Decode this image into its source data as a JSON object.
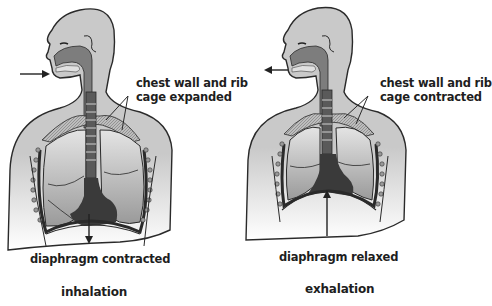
{
  "figures": [
    {
      "id": "inhalation",
      "title": "inhalation",
      "chest_label_line1": "chest wall and rib",
      "chest_label_line2": "cage expanded",
      "diaphragm_label": "diaphragm contracted",
      "airflow_direction": "in",
      "diaphragm_arrow_direction": "down"
    },
    {
      "id": "exhalation",
      "title": "exhalation",
      "chest_label_line1": "chest wall and rib",
      "chest_label_line2": "cage contracted",
      "diaphragm_label": "diaphragm relaxed",
      "airflow_direction": "out",
      "diaphragm_arrow_direction": "up"
    }
  ],
  "colors": {
    "skin": "#c9c9c9",
    "outline": "#2a2a2a",
    "airway": "#7d7d7d",
    "lung": "#b4b4b4",
    "mediastinum": "#3a3a3a",
    "text": "#1e1e1e"
  }
}
